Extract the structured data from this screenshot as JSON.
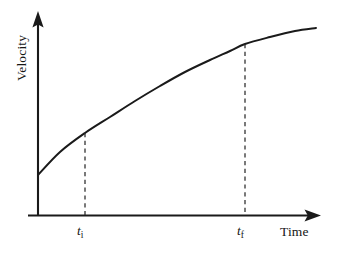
{
  "figure": {
    "background_color": "#ffffff",
    "ink_color": "#1a1a1a",
    "width": 338,
    "height": 253
  },
  "axes": {
    "y_title": "Velocity",
    "x_title": "Time",
    "origin_x": 38,
    "origin_y": 215,
    "x_axis_start": 28,
    "x_axis_arrow_tip": 321,
    "y_axis_arrow_tip": 11,
    "has_tick_marks": false,
    "has_gridlines": false,
    "has_numeric_ticks": false,
    "arrowheads": "both-axes-solid-triangle"
  },
  "annotations": {
    "marker_initial": {
      "variable": "t",
      "subscript": "i",
      "x_px": 85
    },
    "marker_final": {
      "variable": "t",
      "subscript": "f",
      "x_px": 245
    },
    "dashed_style": "vertical dashed drop line from curve to time axis"
  },
  "chart_data": {
    "type": "line",
    "title": "",
    "xlabel": "Time",
    "ylabel": "Velocity",
    "grid": false,
    "legend": null,
    "axis_ticks": {
      "x": [
        "t i",
        "t f"
      ],
      "y": []
    },
    "xlim": [
      0,
      1
    ],
    "ylim": [
      0,
      1
    ],
    "series": [
      {
        "name": "velocity",
        "shape": "concave-down increasing",
        "points_px": [
          [
            38,
            175
          ],
          [
            60,
            152
          ],
          [
            85,
            133
          ],
          [
            110,
            117
          ],
          [
            135,
            101
          ],
          [
            160,
            86
          ],
          [
            185,
            72
          ],
          [
            210,
            60
          ],
          [
            230,
            51
          ],
          [
            245,
            44
          ],
          [
            270,
            37
          ],
          [
            295,
            31
          ],
          [
            316,
            28
          ]
        ],
        "points_normalized": [
          [
            0.0,
            0.22
          ],
          [
            0.08,
            0.33
          ],
          [
            0.17,
            0.42
          ],
          [
            0.26,
            0.5
          ],
          [
            0.35,
            0.58
          ],
          [
            0.44,
            0.65
          ],
          [
            0.53,
            0.72
          ],
          [
            0.62,
            0.78
          ],
          [
            0.69,
            0.82
          ],
          [
            0.74,
            0.85
          ],
          [
            0.83,
            0.89
          ],
          [
            0.92,
            0.92
          ],
          [
            1.0,
            0.93
          ]
        ]
      }
    ],
    "markers": [
      {
        "label": "t i",
        "x_px": 85,
        "curve_y_px": 133,
        "axis_y_px": 215
      },
      {
        "label": "t f",
        "x_px": 245,
        "curve_y_px": 44,
        "axis_y_px": 215
      }
    ]
  }
}
